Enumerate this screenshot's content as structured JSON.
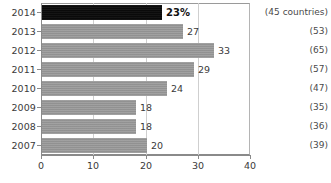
{
  "chart_data": {
    "type": "bar",
    "orientation": "horizontal",
    "title": "",
    "subtitle": "",
    "xlabel": "",
    "ylabel": "",
    "xlim": [
      0,
      40
    ],
    "xticks": [
      0,
      10,
      20,
      30,
      40
    ],
    "xtick_labels": [
      "0",
      "10",
      "20",
      "30",
      "40"
    ],
    "grid": true,
    "grid_axis": "x",
    "legend": false,
    "categories": [
      "2014",
      "2013",
      "2012",
      "2011",
      "2010",
      "2009",
      "2008",
      "2007"
    ],
    "values": [
      23,
      27,
      33,
      29,
      24,
      18,
      18,
      20
    ],
    "value_labels": [
      "23%",
      "27",
      "33",
      "29",
      "24",
      "18",
      "18",
      "20"
    ],
    "highlighted_category": "2014",
    "annotations": [
      "(45 countries)",
      "(53)",
      "(65)",
      "(57)",
      "(47)",
      "(35)",
      "(36)",
      "(39)"
    ],
    "colors": {
      "bar": "#969696",
      "bar_highlight": "#0b0b0b",
      "axis": "#8a8a8a",
      "grid": "#cfcfcf",
      "text": "#3a3a3a",
      "background": "#ffffff"
    }
  },
  "rows": [
    {
      "year": "2014",
      "value": 23,
      "label": "23%",
      "note": "(45 countries)",
      "highlight": true
    },
    {
      "year": "2013",
      "value": 27,
      "label": "27",
      "note": "(53)",
      "highlight": false
    },
    {
      "year": "2012",
      "value": 33,
      "label": "33",
      "note": "(65)",
      "highlight": false
    },
    {
      "year": "2011",
      "value": 29,
      "label": "29",
      "note": "(57)",
      "highlight": false
    },
    {
      "year": "2010",
      "value": 24,
      "label": "24",
      "note": "(47)",
      "highlight": false
    },
    {
      "year": "2009",
      "value": 18,
      "label": "18",
      "note": "(35)",
      "highlight": false
    },
    {
      "year": "2008",
      "value": 18,
      "label": "18",
      "note": "(36)",
      "highlight": false
    },
    {
      "year": "2007",
      "value": 20,
      "label": "20",
      "note": "(39)",
      "highlight": false
    }
  ],
  "axis": {
    "ticks": [
      {
        "value": 0,
        "label": "0"
      },
      {
        "value": 10,
        "label": "10"
      },
      {
        "value": 20,
        "label": "20"
      },
      {
        "value": 30,
        "label": "30"
      },
      {
        "value": 40,
        "label": "40"
      }
    ]
  }
}
